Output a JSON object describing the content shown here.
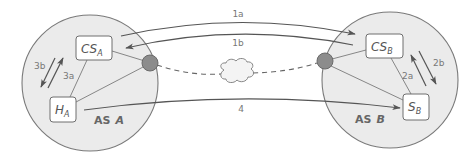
{
  "diagram": {
    "colors": {
      "as_fill": "#ebebeb",
      "as_stroke": "#7a7a7a",
      "router_fill": "#8c8c8c",
      "arrow": "#555555",
      "label": "#777777"
    },
    "as_a": {
      "label_prefix": "AS",
      "label_name": "A",
      "cs": {
        "main": "CS",
        "sub": "A"
      },
      "host": {
        "main": "H",
        "sub": "A"
      },
      "arrow_3a": "3a",
      "arrow_3b": "3b"
    },
    "as_b": {
      "label_prefix": "AS",
      "label_name": "B",
      "cs": {
        "main": "CS",
        "sub": "B"
      },
      "server": {
        "main": "S",
        "sub": "B"
      },
      "arrow_2a": "2a",
      "arrow_2b": "2b"
    },
    "inter_as": {
      "arrow_1a": "1a",
      "arrow_1b": "1b",
      "arrow_4": "4",
      "network": "cloud"
    }
  }
}
